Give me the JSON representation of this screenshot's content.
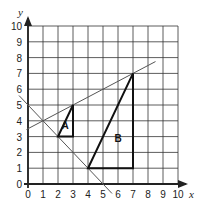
{
  "chart_data": {
    "type": "diagram",
    "title": "",
    "xlabel": "x",
    "ylabel": "y",
    "xlim": [
      0,
      10
    ],
    "ylim": [
      0,
      10
    ],
    "grid": true,
    "x_ticks": [
      "0",
      "1",
      "2",
      "3",
      "4",
      "5",
      "6",
      "7",
      "8",
      "9",
      "10"
    ],
    "y_ticks": [
      "0",
      "1",
      "2",
      "3",
      "4",
      "5",
      "6",
      "7",
      "8",
      "9",
      "10"
    ],
    "shapes": [
      {
        "label": "A",
        "type": "triangle",
        "vertices": [
          [
            2,
            3
          ],
          [
            3,
            3
          ],
          [
            3,
            5
          ]
        ]
      },
      {
        "label": "B",
        "type": "triangle",
        "vertices": [
          [
            4,
            1
          ],
          [
            7,
            1
          ],
          [
            7,
            7
          ]
        ]
      }
    ],
    "lines": [
      {
        "name": "enlargement-ray",
        "from": [
          -0.1,
          3.45
        ],
        "to": [
          8.5,
          7.75
        ]
      },
      {
        "name": "descending-ray",
        "from": [
          -0.6,
          5.6
        ],
        "to": [
          5.6,
          -0.6
        ]
      }
    ]
  },
  "axes": {
    "x_name": "x",
    "y_name": "y"
  },
  "colors": {
    "grid": "#333333",
    "axis": "#222222",
    "shape": "#111111",
    "line": "#555555"
  }
}
